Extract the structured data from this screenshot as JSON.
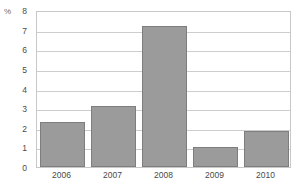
{
  "chart_data": {
    "type": "bar",
    "title": "",
    "subtitle": "",
    "xlabel": "",
    "ylabel": "%",
    "unit_label": "%",
    "categories": [
      "2006",
      "2007",
      "2008",
      "2009",
      "2010"
    ],
    "values": [
      2.3,
      3.1,
      7.2,
      1.0,
      1.85
    ],
    "series": [
      {
        "name": "",
        "values": [
          2.3,
          3.1,
          7.2,
          1.0,
          1.85
        ]
      }
    ],
    "ylim": [
      0,
      8
    ],
    "xlim": [
      0,
      5
    ],
    "y_ticks": [
      "0",
      "1",
      "2",
      "3",
      "4",
      "5",
      "6",
      "7",
      "8"
    ],
    "y_tick_values": [
      0,
      1,
      2,
      3,
      4,
      5,
      6,
      7,
      8
    ],
    "grid": {
      "horizontal": true,
      "vertical": false
    },
    "legend": {
      "visible": false,
      "position": "none",
      "entries": []
    },
    "annotations": [],
    "colors": {
      "bar_fill": "#9b9b9b",
      "bar_stroke": "#7e7e7e",
      "gridline": "#cdcdcd",
      "frame": "#c8c8c8",
      "background": "#ffffff",
      "tick_text": "#4a4a4a",
      "unit_text": "#6e6e6e"
    }
  }
}
